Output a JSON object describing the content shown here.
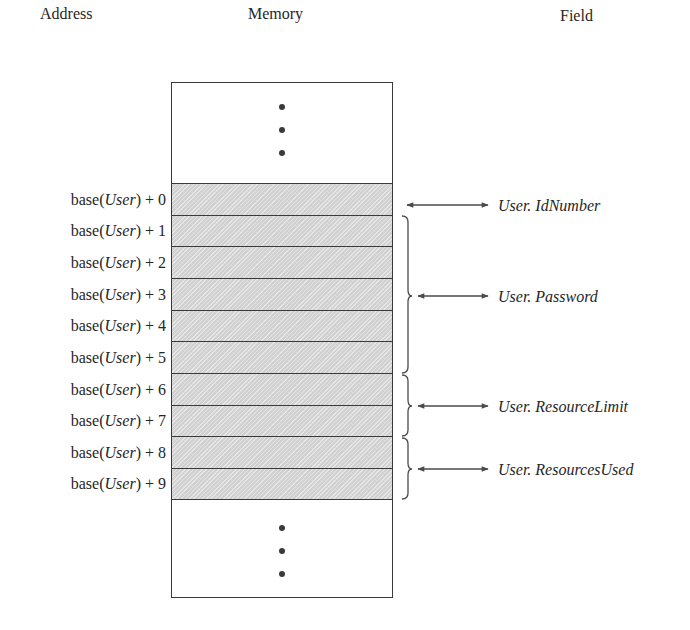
{
  "headers": {
    "address": "Address",
    "memory": "Memory",
    "field": "Field"
  },
  "memory": {
    "ellipsis_top": "⋮",
    "ellipsis_bottom": "⋮",
    "cell_count": 10,
    "shade_color": "#d9d9d9",
    "border_color": "#3a3a3a"
  },
  "addresses": [
    {
      "prefix": "base(",
      "var": "User",
      "suffix": ") + 0"
    },
    {
      "prefix": "base(",
      "var": "User",
      "suffix": ") + 1"
    },
    {
      "prefix": "base(",
      "var": "User",
      "suffix": ") + 2"
    },
    {
      "prefix": "base(",
      "var": "User",
      "suffix": ") + 3"
    },
    {
      "prefix": "base(",
      "var": "User",
      "suffix": ") + 4"
    },
    {
      "prefix": "base(",
      "var": "User",
      "suffix": ") + 5"
    },
    {
      "prefix": "base(",
      "var": "User",
      "suffix": ") + 6"
    },
    {
      "prefix": "base(",
      "var": "User",
      "suffix": ") + 7"
    },
    {
      "prefix": "base(",
      "var": "User",
      "suffix": ") + 8"
    },
    {
      "prefix": "base(",
      "var": "User",
      "suffix": ") + 9"
    }
  ],
  "fields": [
    {
      "label": "User. IdNumber",
      "cells": [
        0,
        0
      ]
    },
    {
      "label": "User. Password",
      "cells": [
        1,
        5
      ]
    },
    {
      "label": "User. ResourceLimit",
      "cells": [
        6,
        7
      ]
    },
    {
      "label": "User. ResourcesUsed",
      "cells": [
        8,
        9
      ]
    }
  ]
}
